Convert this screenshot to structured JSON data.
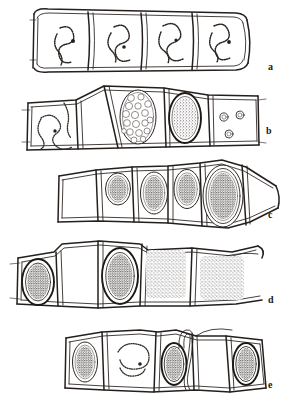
{
  "figure": {
    "width": 292,
    "height": 408,
    "background_color": "#ffffff",
    "ink_color": "#241f1c",
    "style": "pen-and-ink scientific line drawing, monochrome",
    "panel_count": 5
  },
  "panels": [
    {
      "id": "a",
      "label": "a",
      "label_x": 268,
      "label_y": 67,
      "row_y": 10,
      "row_height": 62,
      "caption_text": "a",
      "cell_count": 4,
      "contents": "each cell contains a single slender beaded S-shaped coiled filament (thallus) lying free in the cell lumen",
      "cells": [
        {
          "index": 1,
          "x": 36,
          "y": 12,
          "w": 53,
          "h": 54,
          "inclusion": "beaded-s-coil"
        },
        {
          "index": 2,
          "x": 89,
          "y": 12,
          "w": 52,
          "h": 54,
          "inclusion": "beaded-s-coil"
        },
        {
          "index": 3,
          "x": 141,
          "y": 12,
          "w": 52,
          "h": 54,
          "inclusion": "beaded-s-coil"
        },
        {
          "index": 4,
          "x": 193,
          "y": 12,
          "w": 52,
          "h": 54,
          "inclusion": "beaded-s-coil"
        }
      ]
    },
    {
      "id": "b",
      "label": "b",
      "label_x": 266,
      "label_y": 131,
      "row_y": 88,
      "row_height": 62,
      "caption_text": "b",
      "cell_count": 5,
      "contents": "left cell with beaded coiled filament; a large oval sporangium packed with rounded spores; an oval sporangium with dense granular contents; terminal cell with three small round bodies",
      "cells": [
        {
          "index": 1,
          "x": 30,
          "y": 101,
          "w": 48,
          "h": 49,
          "inclusion": "beaded-s-coil"
        },
        {
          "index": 2,
          "x": 78,
          "y": 95,
          "w": 40,
          "h": 55,
          "inclusion": "empty"
        },
        {
          "index": 3,
          "x": 118,
          "y": 90,
          "w": 46,
          "h": 60,
          "inclusion": "oval-packed-with-spherules"
        },
        {
          "index": 4,
          "x": 164,
          "y": 93,
          "w": 44,
          "h": 57,
          "inclusion": "oval-granular-spore"
        },
        {
          "index": 5,
          "x": 208,
          "y": 96,
          "w": 48,
          "h": 54,
          "inclusion": "three-small-circles"
        }
      ]
    },
    {
      "id": "c",
      "label": "c",
      "label_x": 268,
      "label_y": 215,
      "row_y": 162,
      "row_height": 66,
      "caption_text": "c",
      "cell_count": 6,
      "contents": "row of cells with successively larger stippled oval resting spores surrounded by a thick smooth wall; the largest spore at the right; an empty enlarged terminal cell",
      "cells": [
        {
          "index": 1,
          "x": 60,
          "y": 172,
          "w": 38,
          "h": 48,
          "inclusion": "empty"
        },
        {
          "index": 2,
          "x": 98,
          "y": 168,
          "w": 34,
          "h": 52,
          "inclusion": "small-stippled-oval-spore"
        },
        {
          "index": 3,
          "x": 132,
          "y": 166,
          "w": 34,
          "h": 55,
          "inclusion": "medium-stippled-oval-spore"
        },
        {
          "index": 4,
          "x": 166,
          "y": 166,
          "w": 33,
          "h": 55,
          "inclusion": "medium-stippled-oval-spore"
        },
        {
          "index": 5,
          "x": 199,
          "y": 162,
          "w": 40,
          "h": 66,
          "inclusion": "large-stippled-oval-spore"
        },
        {
          "index": 6,
          "x": 239,
          "y": 166,
          "w": 40,
          "h": 58,
          "inclusion": "empty"
        }
      ]
    },
    {
      "id": "d",
      "label": "d",
      "label_x": 268,
      "label_y": 300,
      "row_y": 240,
      "row_height": 68,
      "caption_text": "d",
      "cell_count": 5,
      "contents": "two cells with dark thick-walled stippled oval resting spores; two cells filled with a loose diffuse stippled mass of liberated contents",
      "cells": [
        {
          "index": 1,
          "x": 20,
          "y": 252,
          "w": 38,
          "h": 56,
          "inclusion": "dark-walled-oval-spore"
        },
        {
          "index": 2,
          "x": 58,
          "y": 246,
          "w": 40,
          "h": 62,
          "inclusion": "empty"
        },
        {
          "index": 3,
          "x": 98,
          "y": 240,
          "w": 42,
          "h": 68,
          "inclusion": "dark-walled-oval-spore"
        },
        {
          "index": 4,
          "x": 140,
          "y": 242,
          "w": 52,
          "h": 64,
          "inclusion": "diffuse-stippled-mass"
        },
        {
          "index": 5,
          "x": 192,
          "y": 246,
          "w": 58,
          "h": 60,
          "inclusion": "diffuse-stippled-mass"
        }
      ]
    },
    {
      "id": "e",
      "label": "e",
      "label_x": 268,
      "label_y": 385,
      "row_y": 322,
      "row_height": 68,
      "caption_text": "e",
      "cell_count": 5,
      "contents": "cells containing stippled oval spores; one cell with an empty beaded coil; a spore with a long narrow germ tube looped up out of the cell",
      "cells": [
        {
          "index": 1,
          "x": 68,
          "y": 330,
          "w": 36,
          "h": 56,
          "inclusion": "stippled-oval-spore"
        },
        {
          "index": 2,
          "x": 104,
          "y": 326,
          "w": 54,
          "h": 62,
          "inclusion": "beaded-open-coil"
        },
        {
          "index": 3,
          "x": 158,
          "y": 328,
          "w": 36,
          "h": 60,
          "inclusion": "spore-with-germ-tube-loop"
        },
        {
          "index": 4,
          "x": 194,
          "y": 326,
          "w": 48,
          "h": 62,
          "inclusion": "empty"
        },
        {
          "index": 5,
          "x": 226,
          "y": 330,
          "w": 40,
          "h": 58,
          "inclusion": "stippled-oval-spore"
        }
      ]
    }
  ],
  "legend": {
    "panel_letters": [
      "a",
      "b",
      "c",
      "d",
      "e"
    ]
  }
}
